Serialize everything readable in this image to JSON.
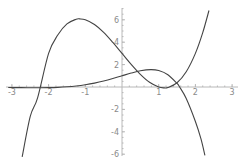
{
  "chart_data": {
    "type": "line",
    "title": "",
    "xlabel": "",
    "ylabel": "",
    "xlim": [
      -3.1,
      3.1
    ],
    "ylim": [
      -6,
      7
    ],
    "grid": false,
    "legend": null,
    "x_ticks": [
      -3,
      -2,
      -1,
      1,
      2,
      3
    ],
    "x_tick_labels": [
      "-3",
      "-2",
      "-1",
      "1",
      "2",
      "3"
    ],
    "y_ticks": [
      -6,
      -4,
      -2,
      2,
      4,
      6
    ],
    "y_tick_labels": [
      "-6",
      "-4",
      "-2",
      "2",
      "4",
      "6"
    ],
    "series": [
      {
        "name": "x^3 - 4x + 3",
        "color": "#444444",
        "x": [
          -2.72,
          -2.5,
          -2.3,
          -2.0,
          -1.75,
          -1.5,
          -1.25,
          -1.15,
          -1.0,
          -0.75,
          -0.5,
          -0.25,
          0.0,
          0.25,
          0.5,
          0.75,
          1.0,
          1.15,
          1.25,
          1.5,
          1.75,
          2.0,
          2.2,
          2.37
        ],
        "y": [
          -6.24,
          -2.63,
          -0.97,
          3.0,
          4.64,
          5.63,
          6.05,
          6.08,
          6.0,
          5.58,
          4.88,
          3.98,
          3.0,
          2.02,
          1.13,
          0.42,
          0.0,
          -0.08,
          -0.05,
          0.38,
          1.36,
          3.0,
          4.85,
          6.83
        ]
      },
      {
        "name": "e^x cos(x)",
        "color": "#444444",
        "x": [
          -3.1,
          -2.75,
          -2.5,
          -2.25,
          -2.0,
          -1.75,
          -1.5,
          -1.25,
          -1.0,
          -0.75,
          -0.5,
          -0.25,
          0.0,
          0.25,
          0.5,
          0.785,
          1.0,
          1.25,
          1.5,
          1.57,
          1.75,
          2.0,
          2.15,
          2.26
        ],
        "y": [
          -0.045,
          -0.059,
          -0.066,
          -0.066,
          -0.056,
          -0.033,
          0.016,
          0.09,
          0.199,
          0.346,
          0.532,
          0.755,
          1.0,
          1.244,
          1.447,
          1.551,
          1.469,
          1.095,
          0.317,
          0.0,
          -1.027,
          -3.075,
          -4.61,
          -6.11
        ]
      }
    ]
  },
  "layout": {
    "origin_px": [
      122,
      87
    ],
    "px_per_unit_x": 36.7,
    "px_per_unit_y": 11.2,
    "x_axis_px": [
      6,
      238
    ],
    "y_axis_px": [
      8,
      156
    ]
  }
}
